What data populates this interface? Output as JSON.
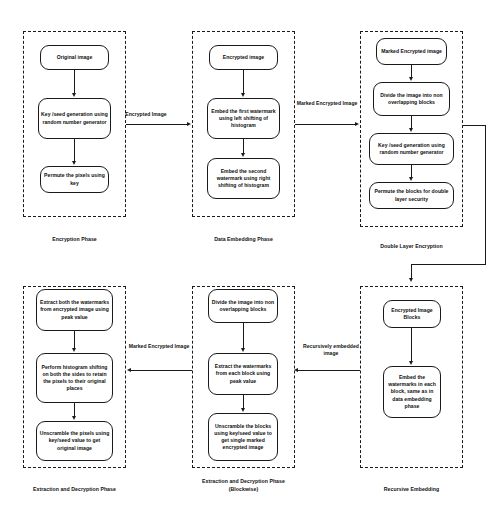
{
  "diagram": {
    "colors": {
      "stroke": "#1a1a1a",
      "text": "#0d0d0d",
      "background": "#ffffff"
    },
    "phases": [
      {
        "id": "encryption-phase",
        "caption": "Encryption Phase",
        "nodes": [
          {
            "id": "original-image",
            "label": "Original image"
          },
          {
            "id": "key-seed-generation",
            "label": "Key /seed generation using random number generator"
          },
          {
            "id": "permute-pixels",
            "label": "Permute the pixels using key"
          }
        ]
      },
      {
        "id": "data-embedding-phase",
        "caption": "Data Embedding Phase",
        "nodes": [
          {
            "id": "encrypted-image",
            "label": "Encrypted image"
          },
          {
            "id": "embed-first-watermark",
            "label": "Embed the first watermark using left shifting of histogram"
          },
          {
            "id": "embed-second-watermark",
            "label": "Embed the second watermark using right shifting of histogram"
          }
        ]
      },
      {
        "id": "double-layer-encryption",
        "caption": "Double Layer Encryption",
        "nodes": [
          {
            "id": "marked-encrypted-image",
            "label": "Marked Encrypted image"
          },
          {
            "id": "divide-image-blocks",
            "label": "Divide the image into non overlapping blocks"
          },
          {
            "id": "key-seed-generation-2",
            "label": "Key /seed generation using random number generator"
          },
          {
            "id": "permute-blocks",
            "label": "Permute the blocks for double layer security"
          }
        ]
      },
      {
        "id": "extraction-decryption-phase",
        "caption": "Extraction and Decryption Phase",
        "nodes": [
          {
            "id": "extract-both-watermarks",
            "label": "Extract both the watermarks from encrypted image using peak value"
          },
          {
            "id": "perform-histogram-shifting",
            "label": "Perform histogram shifting on both the sides to retain the pixels to their original places"
          },
          {
            "id": "unscramble-pixels",
            "label": "Unscramble the pixels using key/seed value to get original image"
          }
        ]
      },
      {
        "id": "extraction-decryption-blockwise",
        "caption": "Extraction and Decryption Phase (Blockwise)",
        "caption_line1": "Extraction and Decryption Phase",
        "caption_line2": "(Blockwise)",
        "nodes": [
          {
            "id": "divide-image-blocks-2",
            "label": "Divide the image into non overlapping blocks"
          },
          {
            "id": "extract-watermarks-blocks",
            "label": "Extract the watermarks from each block using peak value"
          },
          {
            "id": "unscramble-blocks",
            "label": "Unscramble the blocks using key/seed value to get single  marked encrypted image"
          }
        ]
      },
      {
        "id": "recursive-embedding",
        "caption": "Recursive Embedding",
        "nodes": [
          {
            "id": "encrypted-image-blocks",
            "label": "Encrypted Image Blocks"
          },
          {
            "id": "embed-watermarks-blocks",
            "label": "Embed the watermarks  in each block, same as in data embedding phase"
          }
        ]
      }
    ],
    "connectors": [
      {
        "id": "encrypted-image-edge",
        "label": "Encrypted Image",
        "from": "encryption-phase",
        "to": "data-embedding-phase",
        "direction": "right"
      },
      {
        "id": "marked-encrypted-image-edge",
        "label_line1": "Marked Encrypted",
        "label_line2": "Image",
        "from": "data-embedding-phase",
        "to": "double-layer-encryption",
        "direction": "right"
      },
      {
        "id": "double-layer-to-recursive-edge",
        "label": "",
        "from": "double-layer-encryption",
        "to": "recursive-embedding",
        "direction": "down"
      },
      {
        "id": "recursively-embedded-image-edge",
        "label_line1": "Recursively embedded",
        "label_line2": "image",
        "from": "recursive-embedding",
        "to": "extraction-decryption-blockwise",
        "direction": "left"
      },
      {
        "id": "marked-encrypted-image-edge-2",
        "label_line1": "Marked Encrypted",
        "label_line2": "Image",
        "from": "extraction-decryption-blockwise",
        "to": "extraction-decryption-phase",
        "direction": "left"
      }
    ]
  }
}
